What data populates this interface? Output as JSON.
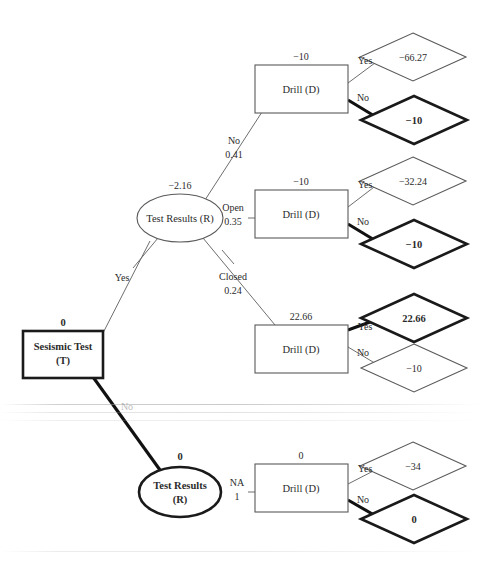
{
  "diagram": {
    "type": "decision-tree",
    "nodes": {
      "root_decision": {
        "label_line1": "Sesismic Test",
        "label_line2": "(T)",
        "value": "0",
        "shape": "rectangle",
        "emphasis": "bold"
      },
      "chance_upper": {
        "label_line1": "Test Results (R)",
        "label_line2": "",
        "value": "−2.16",
        "shape": "ellipse",
        "emphasis": "thin"
      },
      "chance_lower": {
        "label_line1": "Test Results",
        "label_line2": "(R)",
        "value": "0",
        "shape": "ellipse",
        "emphasis": "bold"
      },
      "drill_no": {
        "label_line1": "Drill (D)",
        "value": "−10",
        "shape": "rectangle",
        "emphasis": "thin"
      },
      "drill_open": {
        "label_line1": "Drill (D)",
        "value": "−10",
        "shape": "rectangle",
        "emphasis": "thin"
      },
      "drill_closed": {
        "label_line1": "Drill (D)",
        "value": "22.66",
        "shape": "rectangle",
        "emphasis": "thin"
      },
      "drill_notest": {
        "label_line1": "Drill (D)",
        "value": "0",
        "shape": "rectangle",
        "emphasis": "thin"
      }
    },
    "terminals": {
      "t_no_yes": {
        "value": "−66.27",
        "emphasis": "thin"
      },
      "t_no_no": {
        "value": "−10",
        "emphasis": "bold"
      },
      "t_open_yes": {
        "value": "−32.24",
        "emphasis": "thin"
      },
      "t_open_no": {
        "value": "−10",
        "emphasis": "bold"
      },
      "t_closed_yes": {
        "value": "22.66",
        "emphasis": "bold"
      },
      "t_closed_no": {
        "value": "−10",
        "emphasis": "thin"
      },
      "t_notest_yes": {
        "value": "−34",
        "emphasis": "thin"
      },
      "t_notest_no": {
        "value": "0",
        "emphasis": "bold"
      }
    },
    "edges": {
      "root_yes": {
        "label": "Yes",
        "prob": "",
        "emphasis": "thin"
      },
      "root_no": {
        "label": "No",
        "prob": "",
        "emphasis": "bold"
      },
      "r_no": {
        "label": "No",
        "prob": "0.41",
        "emphasis": "thin"
      },
      "r_open": {
        "label": "Open",
        "prob": "0.35",
        "emphasis": "thin"
      },
      "r_closed": {
        "label": "Closed",
        "prob": "0.24",
        "emphasis": "thin"
      },
      "r_na": {
        "label": "NA",
        "prob": "1",
        "emphasis": "thin"
      },
      "d_no_yes": {
        "label": "Yes",
        "emphasis": "thin"
      },
      "d_no_no": {
        "label": "No",
        "emphasis": "bold"
      },
      "d_open_yes": {
        "label": "Yes",
        "emphasis": "thin"
      },
      "d_open_no": {
        "label": "No",
        "emphasis": "bold"
      },
      "d_closed_yes": {
        "label": "Yes",
        "emphasis": "bold"
      },
      "d_closed_no": {
        "label": "No",
        "emphasis": "thin"
      },
      "d_notest_yes": {
        "label": "Yes",
        "emphasis": "thin"
      },
      "d_notest_no": {
        "label": "No",
        "emphasis": "bold"
      }
    },
    "colors": {
      "background": "#ffffff",
      "thin_stroke": "#595959",
      "bold_stroke": "#111111",
      "text": "#2b2b2b"
    }
  }
}
